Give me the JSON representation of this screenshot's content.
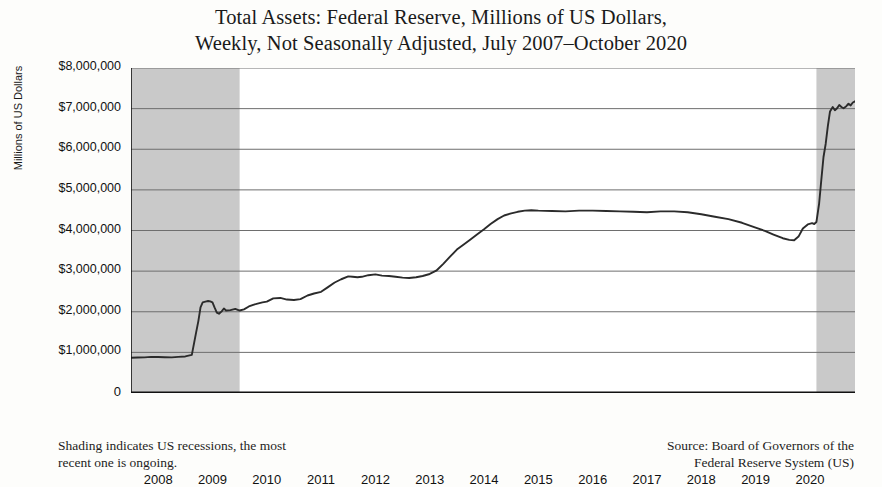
{
  "title": {
    "line1": "Total Assets: Federal Reserve, Millions of US Dollars,",
    "line2": "Weekly, Not Seasonally Adjusted, July 2007–October 2020"
  },
  "footnotes": {
    "left_line1": "Shading indicates US recessions, the most",
    "left_line2": "recent one is ongoing.",
    "right_line1": "Source: Board of Governors of the",
    "right_line2": "Federal Reserve System (US)"
  },
  "colors": {
    "line": "#2b2b2b",
    "grid": "#6e6e6e",
    "axis": "#111111",
    "recession_shading": "#c9c9c9",
    "plot_background": "#ffffff",
    "page_background": "#fdfdfb"
  },
  "chart_data": {
    "type": "line",
    "title": "Total Assets: Federal Reserve, Millions of US Dollars, Weekly, Not Seasonally Adjusted, July 2007–October 2020",
    "xlabel": "",
    "ylabel": "Millions of US Dollars",
    "grid": true,
    "legend_position": "none",
    "xlim": [
      2007.5,
      2020.83
    ],
    "ylim": [
      0,
      8000000
    ],
    "y_ticks": [
      0,
      1000000,
      2000000,
      3000000,
      4000000,
      5000000,
      6000000,
      7000000,
      8000000
    ],
    "y_tick_labels": [
      "0",
      "$1,000,000",
      "$2,000,000",
      "$3,000,000",
      "$4,000,000",
      "$5,000,000",
      "$6,000,000",
      "$7,000,000",
      "$8,000,000"
    ],
    "x_ticks": [
      2008,
      2009,
      2010,
      2011,
      2012,
      2013,
      2014,
      2015,
      2016,
      2017,
      2018,
      2019,
      2020
    ],
    "x_tick_labels": [
      "2008",
      "2009",
      "2010",
      "2011",
      "2012",
      "2013",
      "2014",
      "2015",
      "2016",
      "2017",
      "2018",
      "2019",
      "2020"
    ],
    "annotations": [
      {
        "kind": "shaded-band",
        "label": "US recession (Dec 2007 – Jun 2009)",
        "x_start": 2007.5,
        "x_end": 2009.5
      },
      {
        "kind": "shaded-band",
        "label": "US recession (Feb 2020 – ongoing)",
        "x_start": 2020.12,
        "x_end": 2020.83
      }
    ],
    "series": [
      {
        "name": "Total Assets: Federal Reserve",
        "x": [
          2007.5,
          2007.62,
          2007.75,
          2007.87,
          2008.0,
          2008.12,
          2008.25,
          2008.37,
          2008.5,
          2008.62,
          2008.7,
          2008.74,
          2008.78,
          2008.82,
          2008.87,
          2008.92,
          2008.96,
          2009.0,
          2009.04,
          2009.08,
          2009.12,
          2009.17,
          2009.21,
          2009.25,
          2009.33,
          2009.42,
          2009.5,
          2009.58,
          2009.67,
          2009.75,
          2009.83,
          2009.92,
          2010.0,
          2010.12,
          2010.25,
          2010.37,
          2010.5,
          2010.62,
          2010.75,
          2010.87,
          2011.0,
          2011.12,
          2011.25,
          2011.37,
          2011.5,
          2011.58,
          2011.67,
          2011.75,
          2011.87,
          2012.0,
          2012.12,
          2012.25,
          2012.37,
          2012.5,
          2012.62,
          2012.75,
          2012.87,
          2013.0,
          2013.12,
          2013.25,
          2013.37,
          2013.5,
          2013.62,
          2013.75,
          2013.87,
          2014.0,
          2014.12,
          2014.25,
          2014.37,
          2014.5,
          2014.62,
          2014.75,
          2014.87,
          2015.0,
          2015.25,
          2015.5,
          2015.75,
          2016.0,
          2016.25,
          2016.5,
          2016.75,
          2017.0,
          2017.25,
          2017.5,
          2017.75,
          2018.0,
          2018.25,
          2018.5,
          2018.75,
          2019.0,
          2019.17,
          2019.33,
          2019.5,
          2019.62,
          2019.71,
          2019.79,
          2019.87,
          2019.96,
          2020.04,
          2020.08,
          2020.12,
          2020.17,
          2020.21,
          2020.25,
          2020.29,
          2020.33,
          2020.37,
          2020.42,
          2020.46,
          2020.5,
          2020.54,
          2020.58,
          2020.62,
          2020.67,
          2020.71,
          2020.75,
          2020.79,
          2020.83
        ],
        "y": [
          869000,
          874000,
          878000,
          890000,
          885000,
          880000,
          876000,
          890000,
          900000,
          940000,
          1500000,
          1770000,
          2110000,
          2230000,
          2250000,
          2265000,
          2255000,
          2230000,
          2100000,
          1980000,
          1950000,
          2010000,
          2080000,
          2030000,
          2040000,
          2070000,
          2030000,
          2060000,
          2130000,
          2170000,
          2200000,
          2230000,
          2250000,
          2330000,
          2340000,
          2300000,
          2290000,
          2310000,
          2400000,
          2450000,
          2490000,
          2600000,
          2720000,
          2800000,
          2870000,
          2860000,
          2850000,
          2860000,
          2900000,
          2920000,
          2890000,
          2880000,
          2860000,
          2840000,
          2830000,
          2850000,
          2880000,
          2930000,
          3010000,
          3180000,
          3350000,
          3530000,
          3650000,
          3780000,
          3900000,
          4030000,
          4160000,
          4280000,
          4370000,
          4420000,
          4460000,
          4490000,
          4500000,
          4490000,
          4480000,
          4470000,
          4490000,
          4490000,
          4480000,
          4470000,
          4460000,
          4450000,
          4470000,
          4470000,
          4450000,
          4400000,
          4340000,
          4280000,
          4190000,
          4070000,
          3990000,
          3900000,
          3810000,
          3770000,
          3760000,
          3850000,
          4050000,
          4150000,
          4180000,
          4160000,
          4210000,
          4670000,
          5250000,
          5810000,
          6130000,
          6570000,
          6930000,
          7040000,
          6960000,
          7010000,
          7090000,
          7040000,
          7010000,
          7060000,
          7120000,
          7080000,
          7150000,
          7180000
        ]
      }
    ]
  }
}
